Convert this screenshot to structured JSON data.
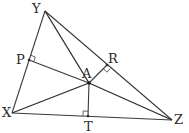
{
  "diagram": {
    "type": "triangle-with-perpendiculars",
    "vertices": [
      "X",
      "Y",
      "Z"
    ],
    "interior_point": "A",
    "feet": [
      "P",
      "R",
      "T"
    ],
    "segments": [
      {
        "from": "X",
        "to": "Y",
        "kind": "side"
      },
      {
        "from": "Y",
        "to": "Z",
        "kind": "side"
      },
      {
        "from": "X",
        "to": "Z",
        "kind": "side"
      },
      {
        "from": "Y",
        "to": "A",
        "kind": "segment"
      },
      {
        "from": "X",
        "to": "A",
        "kind": "segment"
      },
      {
        "from": "Z",
        "to": "A",
        "kind": "segment"
      },
      {
        "from": "A",
        "to": "P",
        "kind": "perpendicular",
        "foot_on": "XY"
      },
      {
        "from": "A",
        "to": "R",
        "kind": "perpendicular",
        "foot_on": "YZ"
      },
      {
        "from": "A",
        "to": "T",
        "kind": "perpendicular",
        "foot_on": "XZ"
      }
    ],
    "labels": {
      "X": "X",
      "Y": "Y",
      "Z": "Z",
      "A": "A",
      "P": "P",
      "R": "R",
      "T": "T"
    },
    "stroke_color": "#3a3a3a"
  }
}
